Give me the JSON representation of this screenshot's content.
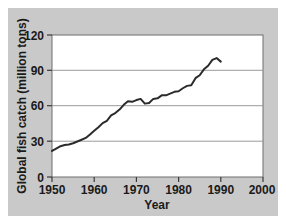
{
  "figure": {
    "background_color": "#ffffff",
    "panel_color": "#c9c9c9",
    "plot_background_color": "#ffffff"
  },
  "chart_data": {
    "type": "line",
    "title": "",
    "xlabel": "Year",
    "ylabel": "Global fish catch (million tons)",
    "xlim": [
      1950,
      2000
    ],
    "ylim": [
      0,
      120
    ],
    "xticks": [
      1950,
      1960,
      1970,
      1980,
      1990,
      2000
    ],
    "yticks": [
      0,
      30,
      60,
      90,
      120
    ],
    "xtick_labels": [
      "1950",
      "1960",
      "1970",
      "1980",
      "1990",
      "2000"
    ],
    "ytick_labels": [
      "0",
      "30",
      "60",
      "90",
      "120"
    ],
    "grid": "horizontal",
    "gridlines_at": [
      30,
      60,
      90
    ],
    "legend": "none",
    "line_color": "#2b2b2b",
    "line_width": 2.0,
    "series": [
      {
        "name": "Global fish catch",
        "units": "million tons",
        "x": [
          1950,
          1951,
          1952,
          1953,
          1954,
          1955,
          1956,
          1957,
          1958,
          1959,
          1960,
          1961,
          1962,
          1963,
          1964,
          1965,
          1966,
          1967,
          1968,
          1969,
          1970,
          1971,
          1972,
          1973,
          1974,
          1975,
          1976,
          1977,
          1978,
          1979,
          1980,
          1981,
          1982,
          1983,
          1984,
          1985,
          1986,
          1987,
          1988,
          1989,
          1990
        ],
        "values": [
          22,
          24,
          26,
          27,
          27.5,
          28.5,
          30,
          31.5,
          33,
          36,
          39,
          42,
          45.5,
          47.5,
          52,
          54,
          57,
          61,
          64,
          63.5,
          65,
          66,
          62,
          62.5,
          66,
          66.5,
          69,
          69,
          70.5,
          72,
          72.5,
          75,
          77,
          77.5,
          83.5,
          86,
          91,
          94,
          99,
          100.5,
          97.5
        ]
      }
    ]
  },
  "axis_labels": {
    "x_title": "Year",
    "y_title": "Global fish catch (million tons)"
  }
}
